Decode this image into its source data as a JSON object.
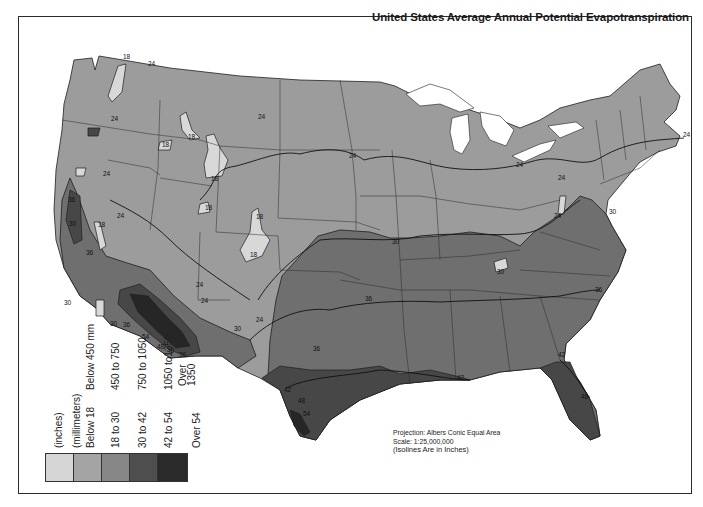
{
  "title": "United States Average Annual Potential Evapotranspiration",
  "legend": {
    "header_inches": "(inches)",
    "header_mm": "(millimeters)",
    "classes": [
      {
        "inches": "Below 18",
        "mm": "Below 450 mm",
        "color": "#d6d6d6"
      },
      {
        "inches": "18 to 30",
        "mm": "450 to 750",
        "color": "#a4a4a4"
      },
      {
        "inches": "30 to 42",
        "mm": "750 to 1050",
        "color": "#878787"
      },
      {
        "inches": "42 to 54",
        "mm": "1050 to1350",
        "color": "#4e4e4e"
      },
      {
        "inches": "Over 54",
        "mm": "Over 1350",
        "color": "#2a2a2a"
      }
    ]
  },
  "notes": {
    "projection": "Projection: Albers Conic Equal Area",
    "scale": "Scale: 1:25,000,000",
    "isolines": "(Isolines Are in Inches)"
  },
  "map_colors": {
    "zone_18_30": "#9c9c9c",
    "zone_below_18": "#d8d8d8",
    "zone_30_42": "#6f6f6f",
    "zone_42_54": "#474747",
    "zone_over_54": "#262626",
    "lakes": "#ffffff",
    "lines": "#1e1e1e"
  },
  "isoline_labels": [
    {
      "text": "18",
      "x": 123,
      "y": 59
    },
    {
      "text": "24",
      "x": 148,
      "y": 66
    },
    {
      "text": "24",
      "x": 111,
      "y": 121
    },
    {
      "text": "18",
      "x": 162,
      "y": 147
    },
    {
      "text": "18",
      "x": 188,
      "y": 139
    },
    {
      "text": "24",
      "x": 103,
      "y": 176
    },
    {
      "text": "18",
      "x": 211,
      "y": 181
    },
    {
      "text": "24",
      "x": 258,
      "y": 119
    },
    {
      "text": "24",
      "x": 349,
      "y": 158
    },
    {
      "text": "24",
      "x": 516,
      "y": 167
    },
    {
      "text": "24",
      "x": 558,
      "y": 180
    },
    {
      "text": "24",
      "x": 683,
      "y": 137
    },
    {
      "text": "24",
      "x": 554,
      "y": 218
    },
    {
      "text": "30",
      "x": 609,
      "y": 214
    },
    {
      "text": "24",
      "x": 117,
      "y": 218
    },
    {
      "text": "30",
      "x": 69,
      "y": 226
    },
    {
      "text": "18",
      "x": 98,
      "y": 227
    },
    {
      "text": "36",
      "x": 68,
      "y": 202
    },
    {
      "text": "36",
      "x": 86,
      "y": 255
    },
    {
      "text": "18",
      "x": 205,
      "y": 210
    },
    {
      "text": "18",
      "x": 256,
      "y": 219
    },
    {
      "text": "18",
      "x": 250,
      "y": 257
    },
    {
      "text": "24",
      "x": 196,
      "y": 287
    },
    {
      "text": "24",
      "x": 201,
      "y": 303
    },
    {
      "text": "24",
      "x": 256,
      "y": 322
    },
    {
      "text": "30",
      "x": 64,
      "y": 305
    },
    {
      "text": "30",
      "x": 110,
      "y": 326
    },
    {
      "text": "36",
      "x": 123,
      "y": 327
    },
    {
      "text": "30",
      "x": 234,
      "y": 331
    },
    {
      "text": "54",
      "x": 142,
      "y": 339
    },
    {
      "text": "48",
      "x": 157,
      "y": 349
    },
    {
      "text": "42",
      "x": 167,
      "y": 353
    },
    {
      "text": "36",
      "x": 179,
      "y": 357
    },
    {
      "text": "30",
      "x": 392,
      "y": 244
    },
    {
      "text": "36",
      "x": 313,
      "y": 351
    },
    {
      "text": "30",
      "x": 497,
      "y": 274
    },
    {
      "text": "36",
      "x": 365,
      "y": 301
    },
    {
      "text": "36",
      "x": 595,
      "y": 292
    },
    {
      "text": "42",
      "x": 284,
      "y": 392
    },
    {
      "text": "48",
      "x": 298,
      "y": 403
    },
    {
      "text": "54",
      "x": 303,
      "y": 416
    },
    {
      "text": "42",
      "x": 457,
      "y": 380
    },
    {
      "text": "42",
      "x": 558,
      "y": 357
    },
    {
      "text": "48",
      "x": 581,
      "y": 399
    }
  ]
}
